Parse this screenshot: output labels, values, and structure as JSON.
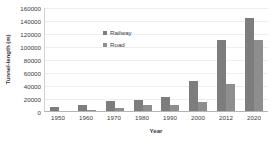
{
  "chart_data": {
    "type": "bar",
    "title": "",
    "xlabel": "Year",
    "ylabel": "Tunnel-length (m)",
    "categories": [
      "1950",
      "1960",
      "1970",
      "1980",
      "1990",
      "2000",
      "2012",
      "2020"
    ],
    "series": [
      {
        "name": "Railway",
        "color": "#7d7d7d",
        "values": [
          6500,
          10000,
          16000,
          16500,
          21500,
          46000,
          110000,
          143000
        ]
      },
      {
        "name": "Road",
        "color": "#8e8e8e",
        "values": [
          0,
          1000,
          5000,
          8500,
          9000,
          14000,
          42000,
          109000
        ]
      }
    ],
    "ylim": [
      0,
      160000
    ],
    "ytick_values": [
      0,
      20000,
      40000,
      60000,
      80000,
      100000,
      120000,
      140000,
      160000
    ],
    "ytick_labels": [
      "0",
      "20000",
      "40000",
      "60000",
      "80000",
      "100000",
      "120000",
      "140000",
      "160000"
    ],
    "grid": true,
    "grid_axis": "y",
    "legend_position": "inside-upper-center",
    "legend": [
      "Railway",
      "Road"
    ]
  }
}
